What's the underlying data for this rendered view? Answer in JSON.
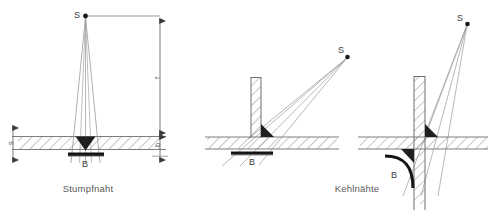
{
  "figure": {
    "title": "",
    "background_color": "#ffffff",
    "line_color": "#808080",
    "hatch_color": "#8a8a8a",
    "solid_color": "#1a1a1a",
    "text_color": "#4d4d4d",
    "width": 488,
    "height": 217
  },
  "panels": [
    {
      "id": "panel-butt-weld",
      "caption": "Stumpfnaht",
      "source_label": "S",
      "film_label": "B",
      "dimensions": [
        {
          "name": "thickness",
          "label": "s",
          "side": "left"
        },
        {
          "name": "focus-distance",
          "label": "f",
          "side": "right"
        },
        {
          "name": "film-offset",
          "label": "b",
          "side": "right"
        }
      ]
    },
    {
      "id": "panel-fillet-tee",
      "caption": "",
      "source_label": "S",
      "film_label": "B",
      "dimensions": []
    },
    {
      "id": "panel-fillet-cross",
      "caption": "Kehlnähte",
      "source_label": "S",
      "film_label": "B",
      "dimensions": []
    }
  ],
  "captions": {
    "left": "Stumpfnaht",
    "right": "Kehlnähte"
  },
  "labels": {
    "source": "S",
    "film": "B",
    "thickness": "s",
    "focus": "f",
    "offset": "b"
  }
}
